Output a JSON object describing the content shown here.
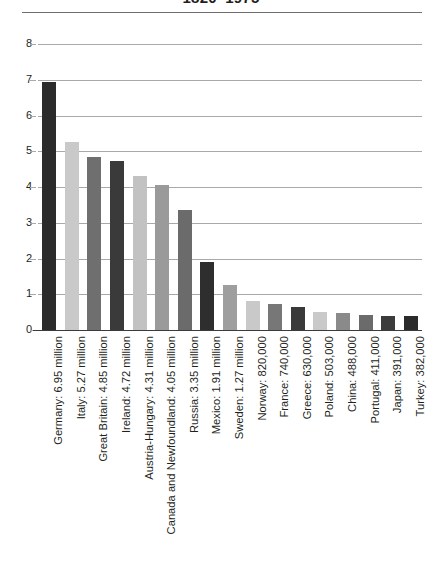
{
  "chart_data": {
    "type": "bar",
    "title": "1820–1975",
    "xlabel": "",
    "ylabel": "",
    "ylim": [
      0,
      8
    ],
    "ytick_labels": [
      "8",
      "7",
      "6",
      "5",
      "4",
      "3",
      "2",
      "1",
      "0"
    ],
    "ytick_values": [
      8,
      7,
      6,
      5,
      4,
      3,
      2,
      1,
      0
    ],
    "grid": true,
    "legend": "none",
    "units": "millions of immigrants",
    "categories": [
      "Germany: 6.95 million",
      "Italy: 5.27 million",
      "Great Britain: 4.85 million",
      "Ireland: 4.72 million",
      "Austria-Hungary: 4.31 million",
      "Canada and Newfoundland: 4.05 million",
      "Russia: 3.35 million",
      "Mexico: 1.91 million",
      "Sweden: 1.27 million",
      "Norway: 820,000",
      "France: 740,000",
      "Greece: 630,000",
      "Poland: 503,000",
      "China: 488,000",
      "Portugal: 411,000",
      "Japan: 391,000",
      "Turkey: 382,000"
    ],
    "values": [
      6.95,
      5.27,
      4.85,
      4.72,
      4.31,
      4.05,
      3.35,
      1.91,
      1.27,
      0.82,
      0.74,
      0.63,
      0.503,
      0.488,
      0.411,
      0.391,
      0.382
    ],
    "bar_colors": [
      "#2b2b2b",
      "#c9c9c9",
      "#6f6f6f",
      "#3a3a3a",
      "#c2c2c2",
      "#9a9a9a",
      "#6b6b6b",
      "#2e2e2e",
      "#9e9e9e",
      "#c9c9c9",
      "#777777",
      "#3a3a3a",
      "#c9c9c9",
      "#8a8a8a",
      "#6b6b6b",
      "#3c3c3c",
      "#2b2b2b"
    ]
  },
  "style": {
    "background": "#ffffff",
    "gridline_color": "#a7a9ac",
    "axis_color": "#3b3b3b",
    "text_color": "#231f20",
    "rule_color": "#6d6e71"
  }
}
